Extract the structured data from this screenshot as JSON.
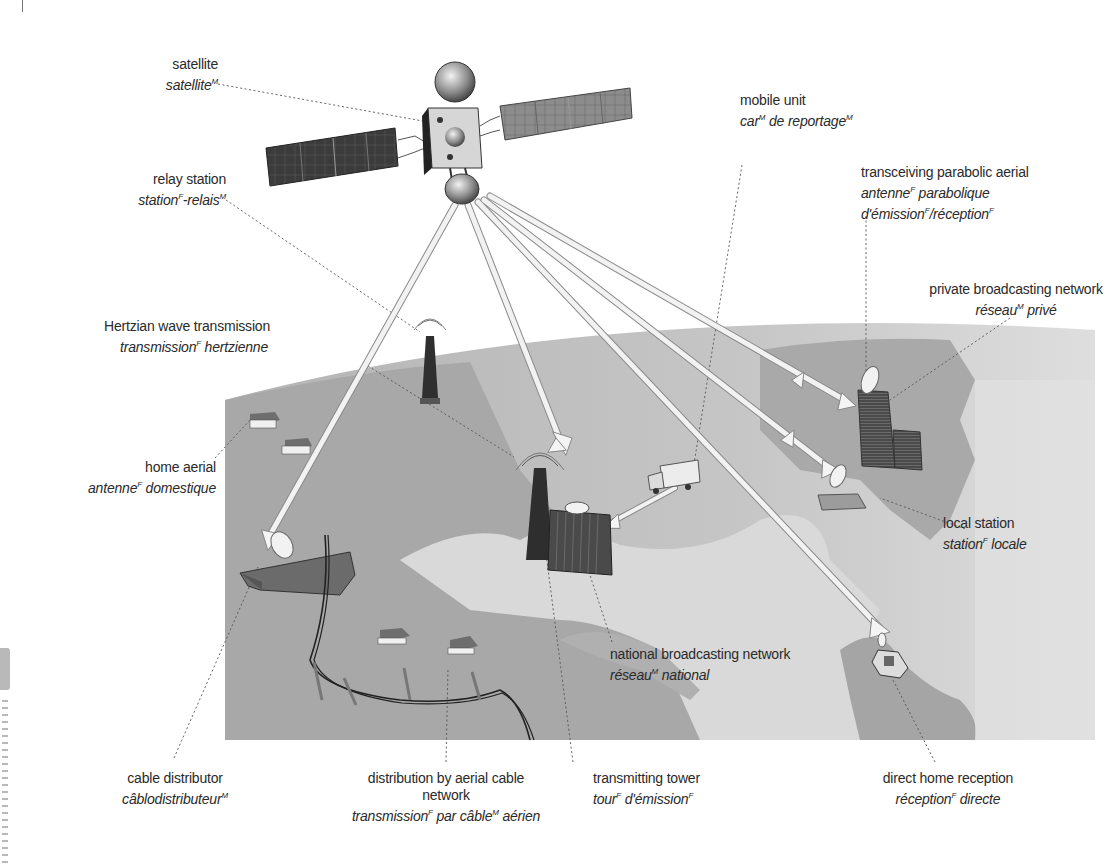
{
  "labels": {
    "satellite": {
      "en": "satellite",
      "fr": "satellite",
      "fr_gender": "M"
    },
    "relay_station": {
      "en": "relay station",
      "fr_parts": [
        {
          "text": "station",
          "gender": "F"
        },
        {
          "text": "-relais",
          "gender": "M"
        }
      ]
    },
    "mobile_unit": {
      "en": "mobile unit",
      "fr_parts": [
        {
          "text": "car",
          "gender": "M"
        },
        {
          "text": " de reportage",
          "gender": "M"
        }
      ]
    },
    "transceiving_aerial": {
      "en": "transceiving parabolic aerial",
      "fr_line1_parts": [
        {
          "text": "antenne",
          "gender": "F"
        },
        {
          "text": " parabolique",
          "gender": ""
        }
      ],
      "fr_line2_parts": [
        {
          "text": "d'émission",
          "gender": "F"
        },
        {
          "text": "/réception",
          "gender": "F"
        }
      ]
    },
    "private_network": {
      "en": "private broadcasting network",
      "fr_parts": [
        {
          "text": "réseau",
          "gender": "M"
        },
        {
          "text": " privé",
          "gender": ""
        }
      ]
    },
    "hertzian": {
      "en": "Hertzian wave transmission",
      "fr_parts": [
        {
          "text": "transmission",
          "gender": "F"
        },
        {
          "text": " hertzienne",
          "gender": ""
        }
      ]
    },
    "home_aerial": {
      "en": "home aerial",
      "fr_parts": [
        {
          "text": "antenne",
          "gender": "F"
        },
        {
          "text": " domestique",
          "gender": ""
        }
      ]
    },
    "local_station": {
      "en": "local station",
      "fr_parts": [
        {
          "text": "station",
          "gender": "F"
        },
        {
          "text": " locale",
          "gender": ""
        }
      ]
    },
    "national_network": {
      "en": "national broadcasting network",
      "fr_parts": [
        {
          "text": "réseau",
          "gender": "M"
        },
        {
          "text": " national",
          "gender": ""
        }
      ]
    },
    "cable_distributor": {
      "en": "cable distributor",
      "fr_parts": [
        {
          "text": "câblodistributeur",
          "gender": "M"
        }
      ]
    },
    "aerial_cable": {
      "en_line1": "distribution by aerial cable",
      "en_line2": "network",
      "fr_parts": [
        {
          "text": "transmission",
          "gender": "F"
        },
        {
          "text": " par câble",
          "gender": "M"
        },
        {
          "text": " aérien",
          "gender": ""
        }
      ]
    },
    "transmitting_tower": {
      "en": "transmitting tower",
      "fr_parts": [
        {
          "text": "tour",
          "gender": "F"
        },
        {
          "text": " d'émission",
          "gender": "F"
        }
      ]
    },
    "direct_home": {
      "en": "direct home reception",
      "fr_parts": [
        {
          "text": "réception",
          "gender": "F"
        },
        {
          "text": " directe",
          "gender": ""
        }
      ]
    }
  },
  "colors": {
    "land_dark": "#a9a9a9",
    "land_mid": "#bdbdbd",
    "land_light": "#dcdcdc",
    "sea": "#cfcfcf",
    "beam": "#eeeeee",
    "leader": "#555555"
  }
}
